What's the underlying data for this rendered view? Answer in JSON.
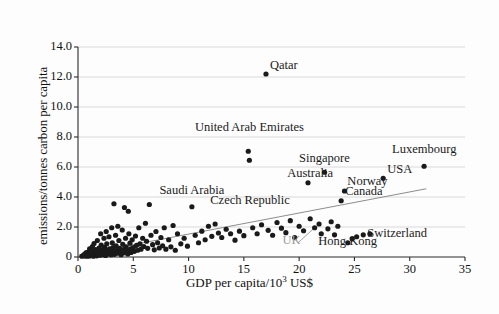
{
  "figure": {
    "background": "#fdfdfd",
    "plot_background": "#ffffff",
    "grid_color": "#c9c9c9",
    "axis_color": "#2b2b2b",
    "point_color": "#1a1a1a",
    "trend_color": "#8d8d8d",
    "muted_label_color": "#9a9a9a"
  },
  "chart_data": {
    "type": "scatter",
    "title": "",
    "subtitle": "",
    "xlabel": "GDP per capita/10³ US$",
    "ylabel": "emissions/tonnes carbon per capita",
    "xlim": [
      0,
      35
    ],
    "ylim": [
      0,
      14
    ],
    "xticks": [
      "0",
      "5",
      "10",
      "15",
      "20",
      "25",
      "30",
      "35"
    ],
    "xtick_values": [
      0,
      5,
      10,
      15,
      20,
      25,
      30,
      35
    ],
    "yticks": [
      "0",
      "2.0",
      "4.0",
      "6.0",
      "8.0",
      "10.0",
      "12.0",
      "14.0"
    ],
    "ytick_values": [
      0,
      2,
      4,
      6,
      8,
      10,
      12,
      14
    ],
    "grid": "horizontal",
    "legend": "none",
    "trendline": {
      "type": "linear",
      "x_start": 0.0,
      "y_start": 0.12,
      "x_end": 31.5,
      "y_end": 4.55
    },
    "annotations": [
      {
        "label": "Qatar",
        "x": 17.0,
        "y": 12.2,
        "anchor": "right",
        "muted": false
      },
      {
        "label": "United Arab Emirates",
        "x": 15.5,
        "y": 8.1,
        "anchor": "center",
        "muted": false
      },
      {
        "label": "Singapore",
        "x": 22.3,
        "y": 6.0,
        "anchor": "center",
        "muted": false
      },
      {
        "label": "Luxembourg",
        "x": 31.3,
        "y": 6.6,
        "anchor": "center",
        "muted": false
      },
      {
        "label": "USA",
        "x": 27.6,
        "y": 5.3,
        "anchor": "right",
        "muted": false
      },
      {
        "label": "Australia",
        "x": 21.0,
        "y": 5.0,
        "anchor": "center",
        "muted": false
      },
      {
        "label": "Norway",
        "x": 24.0,
        "y": 4.5,
        "anchor": "right",
        "muted": false
      },
      {
        "label": "Canada",
        "x": 23.8,
        "y": 3.8,
        "anchor": "right",
        "muted": false
      },
      {
        "label": "Saudi Arabia",
        "x": 10.3,
        "y": 3.9,
        "anchor": "center",
        "muted": false
      },
      {
        "label": "Czech Republic",
        "x": 11.6,
        "y": 3.2,
        "anchor": "right",
        "muted": false
      },
      {
        "label": "Switzerland",
        "x": 25.8,
        "y": 1.0,
        "anchor": "right",
        "muted": false
      },
      {
        "label": "Hong Kong",
        "x": 24.4,
        "y": 0.45,
        "anchor": "center",
        "muted": false
      },
      {
        "label": "UK",
        "x": 19.3,
        "y": 0.55,
        "anchor": "center",
        "muted": true
      }
    ],
    "callout_lines": [
      {
        "from_x": 19.9,
        "from_y": 0.95,
        "to_x": 21.4,
        "to_y": 1.95
      }
    ],
    "points": [
      [
        0.35,
        0.05
      ],
      [
        0.45,
        0.1
      ],
      [
        0.55,
        0.08
      ],
      [
        0.6,
        0.2
      ],
      [
        0.7,
        0.06
      ],
      [
        0.75,
        0.3
      ],
      [
        0.85,
        0.12
      ],
      [
        0.9,
        0.05
      ],
      [
        0.95,
        0.35
      ],
      [
        1.0,
        0.18
      ],
      [
        1.05,
        0.55
      ],
      [
        1.1,
        0.08
      ],
      [
        1.15,
        0.25
      ],
      [
        1.2,
        0.4
      ],
      [
        1.25,
        0.1
      ],
      [
        1.3,
        0.7
      ],
      [
        1.35,
        0.2
      ],
      [
        1.4,
        0.05
      ],
      [
        1.45,
        0.9
      ],
      [
        1.5,
        0.35
      ],
      [
        1.55,
        0.15
      ],
      [
        1.6,
        0.5
      ],
      [
        1.65,
        0.25
      ],
      [
        1.7,
        0.08
      ],
      [
        1.75,
        1.1
      ],
      [
        1.8,
        0.45
      ],
      [
        1.85,
        0.18
      ],
      [
        1.9,
        0.6
      ],
      [
        1.95,
        0.3
      ],
      [
        2.0,
        0.12
      ],
      [
        2.05,
        1.55
      ],
      [
        2.1,
        0.8
      ],
      [
        2.15,
        0.22
      ],
      [
        2.2,
        0.48
      ],
      [
        2.3,
        0.15
      ],
      [
        2.35,
        1.25
      ],
      [
        2.4,
        0.65
      ],
      [
        2.45,
        0.32
      ],
      [
        2.5,
        0.1
      ],
      [
        2.55,
        1.7
      ],
      [
        2.6,
        0.88
      ],
      [
        2.65,
        0.42
      ],
      [
        2.7,
        0.2
      ],
      [
        2.8,
        1.35
      ],
      [
        2.85,
        0.55
      ],
      [
        2.9,
        0.28
      ],
      [
        3.0,
        0.15
      ],
      [
        3.05,
        1.95
      ],
      [
        3.1,
        0.95
      ],
      [
        3.15,
        0.62
      ],
      [
        3.2,
        0.38
      ],
      [
        3.25,
        3.55
      ],
      [
        3.3,
        0.18
      ],
      [
        3.4,
        1.45
      ],
      [
        3.45,
        0.75
      ],
      [
        3.5,
        0.45
      ],
      [
        3.55,
        0.25
      ],
      [
        3.6,
        2.05
      ],
      [
        3.7,
        1.1
      ],
      [
        3.75,
        0.58
      ],
      [
        3.8,
        0.32
      ],
      [
        3.9,
        0.15
      ],
      [
        4.0,
        1.8
      ],
      [
        4.05,
        0.85
      ],
      [
        4.1,
        0.5
      ],
      [
        4.15,
        0.28
      ],
      [
        4.2,
        3.3
      ],
      [
        4.3,
        1.25
      ],
      [
        4.35,
        0.68
      ],
      [
        4.4,
        0.4
      ],
      [
        4.5,
        0.2
      ],
      [
        4.55,
        3.05
      ],
      [
        4.6,
        1.55
      ],
      [
        4.7,
        0.92
      ],
      [
        4.75,
        0.55
      ],
      [
        4.8,
        0.3
      ],
      [
        4.9,
        1.15
      ],
      [
        5.0,
        0.62
      ],
      [
        5.1,
        0.38
      ],
      [
        5.2,
        1.4
      ],
      [
        5.3,
        0.78
      ],
      [
        5.4,
        0.45
      ],
      [
        5.5,
        1.95
      ],
      [
        5.6,
        0.88
      ],
      [
        5.7,
        0.52
      ],
      [
        5.85,
        1.25
      ],
      [
        5.95,
        0.7
      ],
      [
        6.1,
        2.25
      ],
      [
        6.2,
        1.05
      ],
      [
        6.3,
        0.58
      ],
      [
        6.45,
        3.5
      ],
      [
        6.6,
        1.45
      ],
      [
        6.75,
        0.82
      ],
      [
        6.9,
        0.48
      ],
      [
        7.05,
        1.7
      ],
      [
        7.2,
        0.95
      ],
      [
        7.35,
        0.6
      ],
      [
        7.5,
        1.3
      ],
      [
        7.65,
        0.75
      ],
      [
        7.8,
        1.95
      ],
      [
        7.95,
        0.52
      ],
      [
        8.2,
        1.15
      ],
      [
        8.4,
        0.68
      ],
      [
        8.6,
        2.1
      ],
      [
        8.8,
        0.45
      ],
      [
        9.0,
        1.55
      ],
      [
        9.3,
        0.88
      ],
      [
        9.6,
        1.25
      ],
      [
        9.9,
        0.72
      ],
      [
        10.3,
        3.35
      ],
      [
        10.6,
        1.45
      ],
      [
        10.9,
        0.95
      ],
      [
        11.2,
        1.72
      ],
      [
        11.5,
        1.15
      ],
      [
        11.8,
        2.05
      ],
      [
        12.1,
        1.38
      ],
      [
        12.4,
        2.2
      ],
      [
        12.7,
        1.6
      ],
      [
        13.0,
        1.3
      ],
      [
        13.4,
        1.85
      ],
      [
        13.8,
        1.55
      ],
      [
        14.2,
        1.12
      ],
      [
        14.6,
        1.72
      ],
      [
        15.0,
        1.42
      ],
      [
        15.4,
        7.05
      ],
      [
        15.5,
        6.45
      ],
      [
        15.8,
        1.95
      ],
      [
        16.2,
        1.55
      ],
      [
        16.6,
        2.15
      ],
      [
        17.0,
        12.2
      ],
      [
        17.2,
        1.78
      ],
      [
        17.6,
        1.45
      ],
      [
        18.0,
        2.3
      ],
      [
        18.4,
        1.92
      ],
      [
        18.8,
        1.62
      ],
      [
        19.2,
        2.42
      ],
      [
        19.6,
        1.3
      ],
      [
        20.0,
        2.05
      ],
      [
        20.4,
        1.75
      ],
      [
        20.8,
        4.95
      ],
      [
        21.0,
        2.55
      ],
      [
        21.4,
        1.95
      ],
      [
        21.8,
        2.2
      ],
      [
        22.0,
        1.55
      ],
      [
        22.3,
        5.65
      ],
      [
        22.6,
        1.88
      ],
      [
        22.9,
        2.35
      ],
      [
        23.2,
        1.48
      ],
      [
        23.5,
        2.05
      ],
      [
        23.8,
        3.75
      ],
      [
        24.1,
        4.4
      ],
      [
        24.4,
        0.95
      ],
      [
        24.8,
        1.22
      ],
      [
        25.2,
        1.35
      ],
      [
        25.8,
        1.48
      ],
      [
        26.4,
        1.55
      ],
      [
        27.6,
        5.25
      ],
      [
        31.3,
        6.05
      ]
    ]
  }
}
